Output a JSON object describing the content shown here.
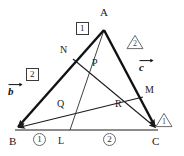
{
  "figure": {
    "stroke_color": "#1a1a1a",
    "thin_color": "#2b2b2b",
    "badge_color": "#555555",
    "vertices": [
      {
        "name": "A",
        "label": "A",
        "x": 104,
        "y": 30
      },
      {
        "name": "B",
        "label": "B",
        "x": 15,
        "y": 130
      },
      {
        "name": "C",
        "label": "C",
        "x": 158,
        "y": 130
      }
    ],
    "points": [
      {
        "name": "N",
        "label": "N",
        "x": 73,
        "y": 59
      },
      {
        "name": "P",
        "label": "P",
        "x": 98,
        "y": 72
      },
      {
        "name": "Q",
        "label": "Q",
        "x": 70,
        "y": 110
      },
      {
        "name": "R",
        "label": "R",
        "x": 124,
        "y": 108
      },
      {
        "name": "M",
        "label": "M",
        "x": 143,
        "y": 97
      },
      {
        "name": "L",
        "label": "L",
        "x": 70,
        "y": 130
      }
    ],
    "vertex_labels": [
      {
        "label": "A",
        "x": 104,
        "y": 13
      },
      {
        "label": "B",
        "x": 13,
        "y": 142
      },
      {
        "label": "C",
        "x": 157,
        "y": 142
      }
    ],
    "point_labels": [
      {
        "label": "N",
        "x": 65,
        "y": 51
      },
      {
        "label": "P",
        "x": 96,
        "y": 63
      },
      {
        "label": "Q",
        "x": 62,
        "y": 104
      },
      {
        "label": "R",
        "x": 119,
        "y": 104
      },
      {
        "label": "M",
        "x": 148,
        "y": 90
      },
      {
        "label": "L",
        "x": 62,
        "y": 142
      }
    ],
    "ratio_badges": {
      "side_AB": [
        {
          "value": "1",
          "style": "boxed",
          "x": 82,
          "y": 28
        },
        {
          "value": "2",
          "style": "boxed",
          "x": 31,
          "y": 74
        }
      ],
      "side_AC": [
        {
          "value": "2",
          "style": "triangle",
          "x": 133,
          "y": 41
        },
        {
          "value": "1",
          "style": "triangle",
          "x": 162,
          "y": 103
        }
      ],
      "side_BC": [
        {
          "value": "1",
          "style": "circled",
          "x": 38,
          "y": 137
        },
        {
          "value": "2",
          "style": "circled",
          "x": 108,
          "y": 137
        }
      ]
    },
    "vectors": [
      {
        "name": "b",
        "glyph": "b",
        "x": 13,
        "y": 86,
        "from": "A",
        "to": "B"
      },
      {
        "name": "c",
        "glyph": "c",
        "x": 143,
        "y": 62,
        "from": "A",
        "to": "C"
      }
    ],
    "segments": [
      {
        "name": "side-AB",
        "from": "A",
        "to": "B",
        "weight": "thick",
        "arrow": "end"
      },
      {
        "name": "side-AC",
        "from": "A",
        "to": "C",
        "weight": "thick",
        "arrow": "end"
      },
      {
        "name": "side-BC",
        "from": "B",
        "to": "C",
        "weight": "thin",
        "arrow": "none"
      },
      {
        "name": "cevian-A-L",
        "from": "A",
        "to": "L",
        "weight": "thin",
        "arrow": "none"
      },
      {
        "name": "cevian-N-C",
        "from": "N",
        "to": "C",
        "weight": "thin",
        "arrow": "end"
      },
      {
        "name": "cevian-M-B",
        "from": "M",
        "to": "B",
        "weight": "thin",
        "arrow": "end"
      }
    ]
  }
}
